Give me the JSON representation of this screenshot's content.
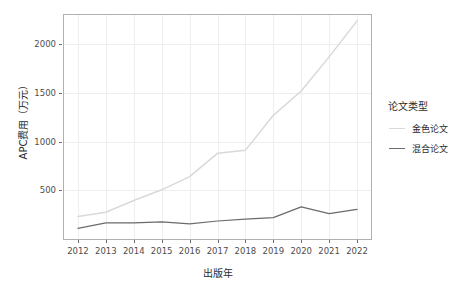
{
  "chart_data": {
    "type": "line",
    "title": "",
    "xlabel": "出版年",
    "ylabel": "APC费用（万元）",
    "x": [
      2012,
      2013,
      2014,
      2015,
      2016,
      2017,
      2018,
      2019,
      2020,
      2021,
      2022
    ],
    "xtick_labels": [
      "2012",
      "2013",
      "2014",
      "2015",
      "2016",
      "2017",
      "2018",
      "2019",
      "2020",
      "2021",
      "2022"
    ],
    "ytick_labels": [
      "500",
      "1000",
      "1500",
      "2000"
    ],
    "yticks": [
      500,
      1000,
      1500,
      2000
    ],
    "ylim": [
      0,
      2300
    ],
    "xlim": [
      2011.5,
      2022.5
    ],
    "grid": true,
    "legend_position": "right",
    "legend_title": "论文类型",
    "series": [
      {
        "name": "金色论文",
        "color": "#d9d9d9",
        "values": [
          230,
          275,
          395,
          505,
          640,
          880,
          910,
          1270,
          1520,
          1870,
          2240
        ]
      },
      {
        "name": "混合论文",
        "color": "#6b6b6b",
        "values": [
          110,
          165,
          165,
          175,
          155,
          185,
          205,
          220,
          330,
          260,
          305
        ]
      }
    ]
  }
}
